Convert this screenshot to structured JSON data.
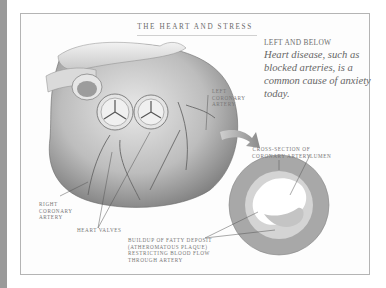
{
  "page": {
    "title": "THE HEART AND STRESS",
    "caption": {
      "heading": "LEFT AND BELOW",
      "text": "Heart disease, such as blocked arteries, is a common cause of anxiety today."
    },
    "labels": {
      "left_coronary_artery": [
        "LEFT",
        "CORONARY",
        "ARTERY"
      ],
      "right_coronary_artery": [
        "RIGHT",
        "CORONARY",
        "ARTERY"
      ],
      "heart_valves": "HEART VALVES",
      "cross_section": [
        "CROSS-SECTION OF",
        "CORONARY ARTERY"
      ],
      "lumen": "LUMEN",
      "buildup": [
        "BUILDUP OF FATTY DEPOSIT",
        "(ATHEROMATOUS PLAQUE)",
        "RESTRICTING BLOOD FLOW",
        "THROUGH ARTERY"
      ]
    },
    "colors": {
      "spine": "#9a9a9a",
      "frame_border": "#b4b4b4",
      "artery_wall": "#a8a8a8",
      "plaque": "#c4c4c4"
    }
  }
}
